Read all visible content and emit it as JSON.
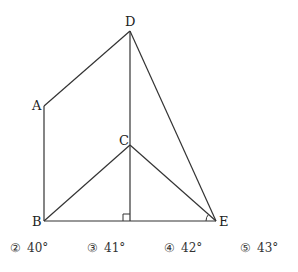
{
  "diagram": {
    "points": {
      "A": {
        "label": "A",
        "x": 44,
        "y": 106
      },
      "B": {
        "label": "B",
        "x": 44,
        "y": 221
      },
      "C": {
        "label": "C",
        "x": 130,
        "y": 145
      },
      "D": {
        "label": "D",
        "x": 130,
        "y": 31
      },
      "E": {
        "label": "E",
        "x": 216,
        "y": 221
      }
    },
    "segments": [
      "AD",
      "AB",
      "DC",
      "DE",
      "BC",
      "CE",
      "BE",
      "C-foot"
    ],
    "markers": {
      "right_angle": "foot of perpendicular from C on BE",
      "angle_mark": "angle at E"
    },
    "line_color": "#333333"
  },
  "choices": [
    {
      "num": "②",
      "value": "40°"
    },
    {
      "num": "③",
      "value": "41°"
    },
    {
      "num": "④",
      "value": "42°"
    },
    {
      "num": "⑤",
      "value": "43°"
    }
  ]
}
